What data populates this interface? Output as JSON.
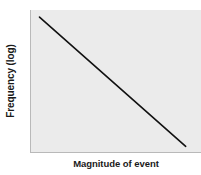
{
  "chart_data": {
    "type": "line",
    "title": "",
    "subtitle": "",
    "xlabel": "Magnitude of event",
    "ylabel": "Frequency (log)",
    "series": [
      {
        "name": "power-law relationship",
        "points": [
          {
            "x": 0.05,
            "y": 0.95
          },
          {
            "x": 0.91,
            "y": 0.04
          }
        ]
      }
    ],
    "xlim": [
      0,
      1
    ],
    "ylim": [
      0,
      1
    ],
    "xticks": [],
    "yticks": [],
    "xticklabels": [],
    "yticklabels": [],
    "grid": false,
    "legend": false,
    "legend_position": "none",
    "annotations": [],
    "colors": {
      "line": "#111111",
      "panel_background": "#ebebeb",
      "figure_background": "#ffffff",
      "spine": "#b9b9b9",
      "label_text": "#1a1a1a"
    },
    "line_width_px": 1.6
  },
  "figure": {
    "axis_labels": {
      "y": "Frequency (log)",
      "x": "Magnitude of event"
    }
  }
}
